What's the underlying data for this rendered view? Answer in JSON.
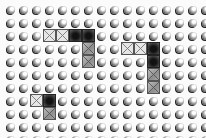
{
  "board": {
    "columns": 16,
    "rows": 11,
    "cell_size_px": 13,
    "origin": {
      "x": 4,
      "y": 3
    },
    "colors": {
      "background": "#fbfbfb",
      "peg": "#4a4a4a",
      "tile_light": "#e6e6e6",
      "tile_medium": "#9e9e9e",
      "tile_dark": "#1a1a1a"
    },
    "tiles": [
      {
        "row": 2,
        "col": 3,
        "type": "light"
      },
      {
        "row": 2,
        "col": 4,
        "type": "light"
      },
      {
        "row": 2,
        "col": 5,
        "type": "dark"
      },
      {
        "row": 2,
        "col": 6,
        "type": "dark"
      },
      {
        "row": 3,
        "col": 6,
        "type": "medium"
      },
      {
        "row": 4,
        "col": 6,
        "type": "medium"
      },
      {
        "row": 3,
        "col": 9,
        "type": "light"
      },
      {
        "row": 3,
        "col": 10,
        "type": "light"
      },
      {
        "row": 3,
        "col": 11,
        "type": "dark"
      },
      {
        "row": 4,
        "col": 11,
        "type": "dark"
      },
      {
        "row": 5,
        "col": 11,
        "type": "medium"
      },
      {
        "row": 6,
        "col": 11,
        "type": "medium"
      },
      {
        "row": 7,
        "col": 2,
        "type": "light"
      },
      {
        "row": 7,
        "col": 3,
        "type": "dark"
      },
      {
        "row": 8,
        "col": 3,
        "type": "medium"
      }
    ]
  }
}
